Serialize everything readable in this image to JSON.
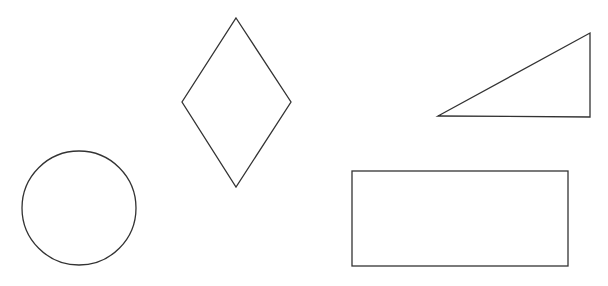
{
  "diagram": {
    "title": "",
    "shapes": [
      {
        "id": "circle",
        "kind": "circle"
      },
      {
        "id": "diamond",
        "kind": "rhombus"
      },
      {
        "id": "triangle",
        "kind": "right-triangle"
      },
      {
        "id": "rectangle",
        "kind": "rectangle"
      }
    ],
    "stroke_color": "#333333",
    "background_color": "#ffffff"
  }
}
